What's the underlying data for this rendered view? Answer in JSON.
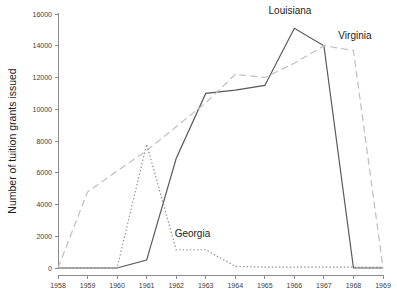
{
  "chart_data": {
    "type": "line",
    "title": "",
    "xlabel": "",
    "ylabel": "Number of tuition grants issued",
    "x": [
      1958,
      1959,
      1960,
      1961,
      1962,
      1963,
      1964,
      1965,
      1966,
      1967,
      1968,
      1969
    ],
    "xtick_labels": [
      "1958",
      "1959",
      "1960",
      "1961",
      "1962",
      "1963",
      "1964",
      "1965",
      "1966",
      "1967",
      "1968",
      "1969"
    ],
    "ytick_labels": [
      "0",
      "2000",
      "4000",
      "6000",
      "8000",
      "10000",
      "12000",
      "14000",
      "16000"
    ],
    "ytick_values": [
      0,
      2000,
      4000,
      6000,
      8000,
      10000,
      12000,
      14000,
      16000
    ],
    "xlim": [
      1958,
      1969
    ],
    "ylim": [
      0,
      16000
    ],
    "grid": false,
    "legend": "inline-annotations",
    "series": [
      {
        "name": "Louisiana",
        "style": "solid",
        "color": "#595959",
        "label_x": 1965.85,
        "label_y": 16000,
        "values": [
          0,
          0,
          0,
          500,
          6900,
          11000,
          11200,
          11500,
          15100,
          14000,
          0,
          0
        ]
      },
      {
        "name": "Virginia",
        "style": "dashed",
        "color": "#bfbfbf",
        "label_x": 1968.05,
        "label_y": 14450,
        "values": [
          0,
          4800,
          6100,
          7400,
          8900,
          10400,
          12200,
          12000,
          12900,
          14000,
          13700,
          0
        ]
      },
      {
        "name": "Georgia",
        "style": "dotted",
        "color": "#8c8c8c",
        "label_x": 1962.55,
        "label_y": 1950,
        "values": [
          0,
          0,
          0,
          7800,
          1150,
          1150,
          100,
          60,
          60,
          60,
          60,
          60
        ]
      }
    ]
  },
  "axes": {
    "y_axis_title": "Number of tuition grants issued"
  }
}
